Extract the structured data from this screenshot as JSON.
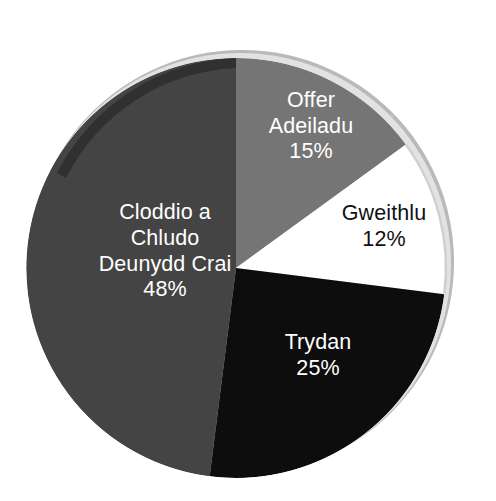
{
  "chart_data": {
    "type": "pie",
    "title": "",
    "subtitle": "",
    "xlabel": "",
    "ylabel": "",
    "legend_position": "none",
    "grid": false,
    "labels_inside_slices": true,
    "categories": [
      "Offer Adeiladu",
      "Gweithlu",
      "Trydan",
      "Cloddio a Chludo Deunydd Crai"
    ],
    "values": [
      15,
      12,
      25,
      48
    ],
    "value_suffix": "%",
    "start_angle_deg": -90,
    "direction": "clockwise",
    "slices": [
      {
        "name": "Offer Adeiladu",
        "label_lines": [
          "Offer",
          "Adeiladu"
        ],
        "value": 15,
        "value_label": "15%",
        "color": "#757575",
        "text_color": "#ffffff",
        "start_deg": 0,
        "end_deg": 54
      },
      {
        "name": "Gweithlu",
        "label_lines": [
          "Gweithlu"
        ],
        "value": 12,
        "value_label": "12%",
        "color": "#ffffff",
        "text_color": "#111111",
        "start_deg": 54,
        "end_deg": 97.2
      },
      {
        "name": "Trydan",
        "label_lines": [
          "Trydan"
        ],
        "value": 25,
        "value_label": "25%",
        "color": "#0d0d0d",
        "text_color": "#ffffff",
        "start_deg": 97.2,
        "end_deg": 187.2
      },
      {
        "name": "Cloddio a Chludo Deunydd Crai",
        "label_lines": [
          "Cloddio a",
          "Chludo",
          "Deunydd Crai"
        ],
        "value": 48,
        "value_label": "48%",
        "color": "#444444",
        "text_color": "#ffffff",
        "start_deg": 187.2,
        "end_deg": 360
      }
    ],
    "total": 100
  },
  "labels": {
    "offer_adeiladu": {
      "name": "Offer\nAdeiladu",
      "name_line1": "Offer",
      "name_line2": "Adeiladu",
      "value": "15%"
    },
    "gweithlu": {
      "name": "Gweithlu",
      "value": "12%"
    },
    "trydan": {
      "name": "Trydan",
      "value": "25%"
    },
    "cloddio": {
      "name_line1": "Cloddio a",
      "name_line2": "Chludo",
      "name_line3": "Deunydd Crai",
      "value": "48%"
    }
  },
  "colors": {
    "background": "#ffffff",
    "slice_offer_adeiladu": "#757575",
    "slice_gweithlu": "#ffffff",
    "slice_trydan": "#0d0d0d",
    "slice_cloddio": "#444444",
    "rim_shadow": "#2f2f2f",
    "rim_light": "#d8d8d8"
  }
}
